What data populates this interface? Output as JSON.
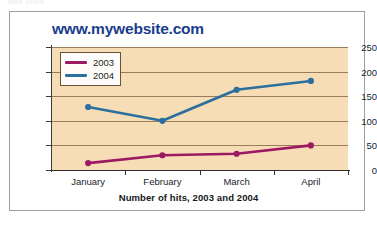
{
  "page": {
    "top_sliver_text": "and 2004"
  },
  "chart": {
    "title": "www.mywebsite.com",
    "caption": "Number of hits, 2003 and 2004",
    "legend": {
      "position": "inside-top-left",
      "entries": [
        {
          "label": "2003",
          "color": "#9c1a63"
        },
        {
          "label": "2004",
          "color": "#2a6f9e"
        }
      ]
    },
    "colors": {
      "plot_background": "#f7ddb6",
      "gridline": "#8a6a4a",
      "axis": "#2d2d2d",
      "title": "#1b3d8c",
      "frame_border": "#9aa0a2",
      "series_2003": "#9c1a63",
      "series_2004": "#2a6f9e"
    }
  },
  "chart_data": {
    "type": "line",
    "title": "www.mywebsite.com",
    "xlabel": "Number of hits, 2003 and 2004",
    "ylabel": "",
    "categories": [
      "January",
      "February",
      "March",
      "April"
    ],
    "yticks": [
      0,
      50,
      100,
      150,
      200,
      250
    ],
    "ylim": [
      0,
      250
    ],
    "grid": true,
    "legend_position": "inside-top-left",
    "series": [
      {
        "name": "2003",
        "color": "#9c1a63",
        "values": [
          14,
          30,
          33,
          50
        ],
        "marker": "circle"
      },
      {
        "name": "2004",
        "color": "#2a6f9e",
        "values": [
          128,
          100,
          163,
          181
        ],
        "marker": "circle"
      }
    ]
  }
}
